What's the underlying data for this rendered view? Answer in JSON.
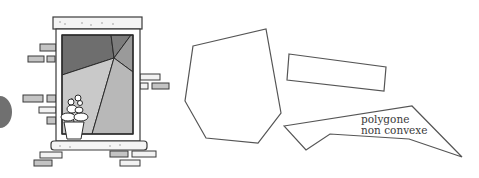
{
  "figure": {
    "type": "illustration",
    "topic": "polygones",
    "colors": {
      "stroke": "#3a3a3a",
      "pane_dark": "#6e6e6e",
      "pane_mid": "#9a9a9a",
      "pane_light": "#c9c9c9",
      "pane_lighter": "#b8b8b8",
      "brick": "#c4c4c4",
      "sill": "#f4f4f4",
      "side_tab": "#707070",
      "background": "#ffffff"
    },
    "window": {
      "description": "window with bricks and flower pot, panes forming polygons"
    },
    "shapes": [
      {
        "id": "convex-heptagon",
        "points": [
          [
            196,
            46
          ],
          [
            266,
            29
          ],
          [
            281,
            113
          ],
          [
            258,
            143
          ],
          [
            208,
            138
          ],
          [
            184,
            101
          ],
          [
            192,
            46
          ]
        ]
      },
      {
        "id": "rectangle",
        "points": [
          [
            289,
            54
          ],
          [
            386,
            67
          ],
          [
            384,
            91
          ],
          [
            287,
            80
          ]
        ]
      },
      {
        "id": "non-convex-polygon",
        "points": [
          [
            284,
            128
          ],
          [
            412,
            106
          ],
          [
            462,
            157
          ],
          [
            409,
            139
          ],
          [
            330,
            135
          ],
          [
            306,
            150
          ]
        ]
      }
    ],
    "labels": {
      "non_convex_line1": "polygone",
      "non_convex_line2": "non convexe"
    }
  }
}
